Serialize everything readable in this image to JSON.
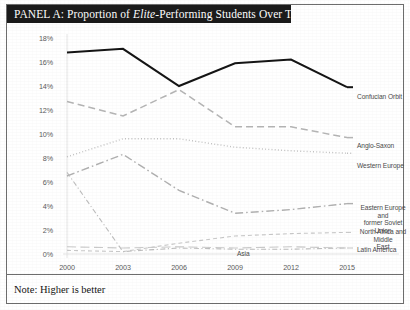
{
  "panel": {
    "title_prefix": "PANEL A: Proportion of ",
    "title_emphasis": "Elite",
    "title_suffix": "-Performing Students Over Time",
    "title_full": "PANEL A: Proportion of Elite-Performing Students Over Time",
    "footnote": "Note: Higher is better",
    "title_bar_color": "#1b1b1b",
    "title_text_color": "#ffffff",
    "frame_color": "#6d6d6d",
    "background_color": "#ffffff"
  },
  "chart_data": {
    "type": "line",
    "title": "PANEL A: Proportion of Elite-Performing Students Over Time",
    "xlabel": "",
    "ylabel": "",
    "x": [
      2000,
      2003,
      2006,
      2009,
      2012,
      2015
    ],
    "categories": [
      "2000",
      "2003",
      "2006",
      "2009",
      "2012",
      "2015"
    ],
    "ylim": [
      0,
      18
    ],
    "ytick_labels": [
      "0%",
      "2%",
      "4%",
      "6%",
      "8%",
      "10%",
      "12%",
      "14%",
      "16%",
      "18%"
    ],
    "ytick_values": [
      0,
      2,
      4,
      6,
      8,
      10,
      12,
      14,
      16,
      18
    ],
    "grid": false,
    "legend_position": "right-inline-labels",
    "series": [
      {
        "name": "Confucian Orbit",
        "values": [
          16.8,
          17.1,
          14.0,
          15.9,
          16.2,
          13.9
        ],
        "style": "solid",
        "color": "#151515",
        "width": 2.0,
        "label_x": 2015,
        "label_y": 13.1
      },
      {
        "name": "Anglo-Saxon",
        "values": [
          12.7,
          11.5,
          13.7,
          10.6,
          10.6,
          9.7
        ],
        "style": "dashed",
        "color": "#b5b5b5",
        "width": 1.5,
        "label_x": 2015,
        "label_y": 9.0
      },
      {
        "name": "Western Europe",
        "values": [
          8.1,
          9.6,
          9.6,
          8.9,
          8.6,
          8.4
        ],
        "style": "dotted",
        "color": "#c2c2c2",
        "width": 1.4,
        "label_x": 2015,
        "label_y": 7.3
      },
      {
        "name": "Eastern Europe and former Soviet Union",
        "values": [
          6.5,
          8.3,
          5.3,
          3.4,
          3.7,
          4.2
        ],
        "style": "dashdot",
        "color": "#b0b0b0",
        "width": 1.4,
        "label_x": 2015,
        "label_y": 3.5
      },
      {
        "name": "North Africa and Middle East",
        "values": [
          0.3,
          0.2,
          0.9,
          1.5,
          1.7,
          1.8
        ],
        "style": "dashed-fine",
        "color": "#c8c8c8",
        "width": 1.1,
        "label_x": 2015,
        "label_y": 1.5
      },
      {
        "name": "Asia",
        "values": [
          6.8,
          0.2,
          0.5,
          0.4,
          0.4,
          0.5
        ],
        "style": "dashdot-fine",
        "color": "#bdbdbd",
        "width": 1.1,
        "label_x": 2009,
        "label_y": 0.45
      },
      {
        "name": "Latin America",
        "values": [
          0.6,
          0.5,
          0.6,
          0.5,
          0.6,
          0.5
        ],
        "style": "dashed-long",
        "color": "#cacaca",
        "width": 1.1,
        "label_x": 2015,
        "label_y": 0.3
      }
    ]
  },
  "series_labels": [
    {
      "text": "Confucian Orbit",
      "lines": [
        "Confucian Orbit"
      ]
    },
    {
      "text": "Anglo-Saxon",
      "lines": [
        "Anglo-Saxon"
      ]
    },
    {
      "text": "Western Europe",
      "lines": [
        "Western Europe"
      ]
    },
    {
      "text": "Eastern Europe and former Soviet Union",
      "lines": [
        "Eastern Europe and",
        "former Soviet Union"
      ]
    },
    {
      "text": "North Africa and Middle East",
      "lines": [
        "North Africa and Middle",
        "East"
      ]
    },
    {
      "text": "Asia",
      "lines": [
        "Asia"
      ]
    },
    {
      "text": "Latin America",
      "lines": [
        "Latin America"
      ]
    }
  ]
}
